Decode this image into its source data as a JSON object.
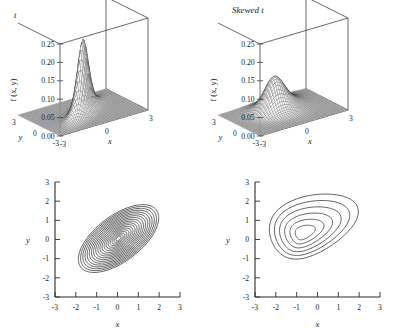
{
  "figure": {
    "background": "#ffffff",
    "line_color": "#2a2a2a",
    "panels": [
      "t",
      "Skewed t"
    ]
  },
  "panels": {
    "left": {
      "title_prefix": "",
      "title": "t",
      "surface": {
        "zlabel": "f (x, y)",
        "z_ticks": [
          "0.25",
          "0.20",
          "0.15",
          "0.10",
          "0.05",
          "0.00"
        ],
        "x_ticks": [
          "-3",
          "0",
          "3"
        ],
        "y_ticks": [
          "3",
          "0",
          "-3"
        ],
        "xlabel": "x",
        "ylabel": "y"
      },
      "contour": {
        "x_ticks": [
          "-3",
          "-2",
          "-1",
          "0",
          "1",
          "2",
          "3"
        ],
        "y_ticks": [
          "3",
          "2",
          "1",
          "0",
          "-1",
          "-2",
          "-3"
        ],
        "xlabel": "x",
        "ylabel": "y"
      }
    },
    "right": {
      "title": "Skewed t",
      "surface": {
        "zlabel": "f (x, y)",
        "z_ticks": [
          "0.25",
          "0.20",
          "0.15",
          "0.10",
          "0.05",
          "0.00"
        ],
        "x_ticks": [
          "-3",
          "0",
          "3"
        ],
        "y_ticks": [
          "3",
          "0",
          "-3"
        ],
        "xlabel": "x",
        "ylabel": "y"
      },
      "contour": {
        "x_ticks": [
          "-3",
          "-2",
          "-1",
          "0",
          "1",
          "2",
          "3"
        ],
        "y_ticks": [
          "3",
          "2",
          "1",
          "0",
          "-1",
          "-2",
          "-3"
        ],
        "xlabel": "x",
        "ylabel": "y"
      }
    }
  },
  "chart_data": [
    {
      "type": "surface",
      "panel": "left",
      "title": "t",
      "zlabel": "f (x, y)",
      "xlabel": "x",
      "ylabel": "y",
      "xlim": [
        -3,
        3
      ],
      "ylim": [
        -3,
        3
      ],
      "zlim": [
        0,
        0.25
      ],
      "z_tick_values": [
        0.0,
        0.05,
        0.1,
        0.15,
        0.2,
        0.25
      ],
      "x_tick_values": [
        -3,
        0,
        3
      ],
      "y_tick_values": [
        3,
        0,
        -3
      ],
      "peak_height": 0.2,
      "peak_location": [
        0,
        0
      ],
      "distribution": "bivariate t, symmetric, correlated",
      "correlation": 0.8,
      "scale": 0.62,
      "skew": [
        0,
        0
      ],
      "grid": false,
      "mesh": "wireframe"
    },
    {
      "type": "surface",
      "panel": "right",
      "title": "Skewed t",
      "zlabel": "f (x, y)",
      "xlabel": "x",
      "ylabel": "y",
      "xlim": [
        -3,
        3
      ],
      "ylim": [
        -3,
        3
      ],
      "zlim": [
        0,
        0.25
      ],
      "z_tick_values": [
        0.0,
        0.05,
        0.1,
        0.15,
        0.2,
        0.25
      ],
      "x_tick_values": [
        -3,
        0,
        3
      ],
      "y_tick_values": [
        3,
        0,
        -3
      ],
      "peak_height": 0.095,
      "peak_location": [
        -0.7,
        0.3
      ],
      "distribution": "bivariate skewed t",
      "correlation": 0.45,
      "scale": 1.0,
      "skew": [
        1.6,
        0.9
      ],
      "grid": false,
      "mesh": "wireframe"
    },
    {
      "type": "contour",
      "panel": "left-bottom",
      "xlabel": "x",
      "ylabel": "y",
      "xlim": [
        -3,
        3
      ],
      "ylim": [
        -3,
        3
      ],
      "x_tick_values": [
        -3,
        -2,
        -1,
        0,
        1,
        2,
        3
      ],
      "y_tick_values": [
        -3,
        -2,
        -1,
        0,
        1,
        2,
        3
      ],
      "n_contours": 19,
      "center": [
        0.05,
        0.05
      ],
      "orientation_deg": 41,
      "semi_major_outer": 2.35,
      "semi_minor_outer": 1.15,
      "shape": "concentric ellipses, positive correlation",
      "grid": false
    },
    {
      "type": "contour",
      "panel": "right-bottom",
      "xlabel": "x",
      "ylabel": "y",
      "xlim": [
        -3,
        3
      ],
      "ylim": [
        -3,
        3
      ],
      "x_tick_values": [
        -3,
        -2,
        -1,
        0,
        1,
        2,
        3
      ],
      "y_tick_values": [
        -3,
        -2,
        -1,
        0,
        1,
        2,
        3
      ],
      "n_contours": 6,
      "center": [
        -0.7,
        0.3
      ],
      "orientation_deg": 28,
      "semi_major_outer": 2.25,
      "semi_minor_outer": 1.5,
      "shape": "skewed nested ovals, elongated toward upper-right",
      "grid": false
    }
  ]
}
